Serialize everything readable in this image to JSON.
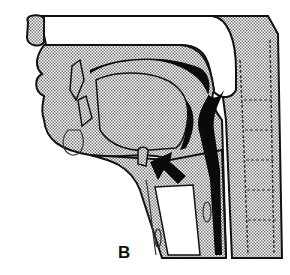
{
  "figure": {
    "panel_label": "B",
    "colors": {
      "background": "#ffffff",
      "tissue_stipple": "#b5b5b5",
      "outline": "#111111",
      "airway_dark": "#0a0a0a"
    }
  }
}
